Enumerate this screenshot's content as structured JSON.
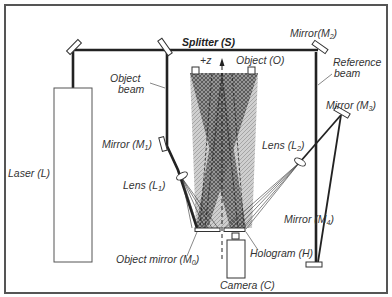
{
  "diagram": {
    "colors": {
      "beam": "#222222",
      "frame": "#555555",
      "object_fill": "#bdbdbd",
      "overlap_fill": "#7a7a7a",
      "text": "#333333"
    },
    "labels": {
      "splitter": "Splitter (S)",
      "object": "Object (O)",
      "plus_z": "+z",
      "mirror_m2": "Mirror(M",
      "mirror_m2_sub": "2",
      "mirror_m2_close": ")",
      "reference_beam_1": "Reference",
      "reference_beam_2": "beam",
      "object_beam_1": "Object",
      "object_beam_2": "beam",
      "mirror_m1": "Mirror (M",
      "mirror_m1_sub": "1",
      "mirror_m1_close": ")",
      "mirror_m3": "Mirror (M",
      "mirror_m3_sub": "3",
      "mirror_m3_close": ")",
      "lens_l2": "Lens (L",
      "lens_l2_sub": "2",
      "lens_l2_close": ")",
      "laser": "Laser (L)",
      "lens_l1": "Lens (L",
      "lens_l1_sub": "1",
      "lens_l1_close": ")",
      "mirror_m4": "Mirror (M",
      "mirror_m4_sub": "4",
      "mirror_m4_close": ")",
      "object_mirror": "Object mirror (M",
      "object_mirror_sub": "0",
      "object_mirror_close": ")",
      "hologram": "Hologram (H)",
      "camera": "Camera (C)"
    }
  }
}
